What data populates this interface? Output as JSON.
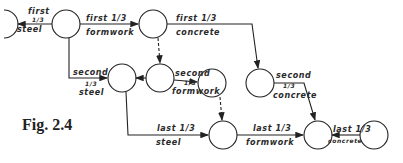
{
  "figure": {
    "caption": "Fig. 2.4",
    "nodes": [
      "n0",
      "n1",
      "n2",
      "n3",
      "n4",
      "n5",
      "n6",
      "n7",
      "n8",
      "n9"
    ],
    "activities": [
      {
        "id": "a1",
        "lines": [
          "first",
          "1/3",
          "steel"
        ]
      },
      {
        "id": "a2",
        "lines": [
          "first 1/3",
          "formwork"
        ]
      },
      {
        "id": "a3",
        "lines": [
          "first 1/3",
          "concrete"
        ]
      },
      {
        "id": "a4",
        "lines": [
          "second",
          "1/3",
          "steel"
        ]
      },
      {
        "id": "a5",
        "lines": [
          "second",
          "1/3",
          "formwork"
        ]
      },
      {
        "id": "a6",
        "lines": [
          "second",
          "1/3",
          "concrete"
        ]
      },
      {
        "id": "a7",
        "lines": [
          "last 1/3",
          "steel"
        ]
      },
      {
        "id": "a8",
        "lines": [
          "last 1/3",
          "formwork"
        ]
      },
      {
        "id": "a9",
        "lines": [
          "last 1/3",
          "concrete"
        ]
      }
    ],
    "dummies": 2
  }
}
